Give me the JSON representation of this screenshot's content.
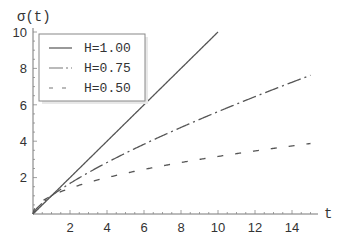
{
  "chart_data": {
    "type": "line",
    "title": "",
    "xlabel": "t",
    "ylabel": "σ(t)",
    "xlim": [
      0,
      15.4
    ],
    "ylim": [
      0,
      10
    ],
    "x_ticks": [
      2,
      4,
      6,
      8,
      10,
      12,
      14
    ],
    "y_ticks": [
      2,
      4,
      6,
      8,
      10
    ],
    "grid": false,
    "legend_position": "upper-left",
    "function": "σ(t) = t^H",
    "series": [
      {
        "name": "H=1.00",
        "H": 1.0,
        "style": "solid",
        "x": [
          0,
          1,
          2,
          4,
          6,
          8,
          10
        ],
        "values": [
          0,
          1,
          2,
          4,
          6,
          8,
          10
        ]
      },
      {
        "name": "H=0.75",
        "H": 0.75,
        "style": "dash-dot",
        "x": [
          0,
          1,
          2,
          4,
          6,
          8,
          10,
          12,
          14,
          15
        ],
        "values": [
          0,
          1,
          1.68,
          2.83,
          3.83,
          4.76,
          5.62,
          6.45,
          7.24,
          7.62
        ]
      },
      {
        "name": "H=0.50",
        "H": 0.5,
        "style": "dashed",
        "x": [
          0,
          1,
          2,
          4,
          6,
          8,
          10,
          12,
          14,
          15
        ],
        "values": [
          0,
          1,
          1.41,
          2.0,
          2.45,
          2.83,
          3.16,
          3.46,
          3.74,
          3.87
        ]
      }
    ]
  },
  "labels": {
    "y_axis": "σ(t)",
    "x_axis": "t",
    "x_ticks": [
      "2",
      "4",
      "6",
      "8",
      "10",
      "12",
      "14"
    ],
    "y_ticks": [
      "2",
      "4",
      "6",
      "8",
      "10"
    ]
  },
  "legend": {
    "items": [
      {
        "label": "H=1.00"
      },
      {
        "label": "H=0.75"
      },
      {
        "label": "H=0.50"
      }
    ]
  },
  "colors": {
    "line": "#555555",
    "axis": "#666666",
    "text": "#333333"
  }
}
